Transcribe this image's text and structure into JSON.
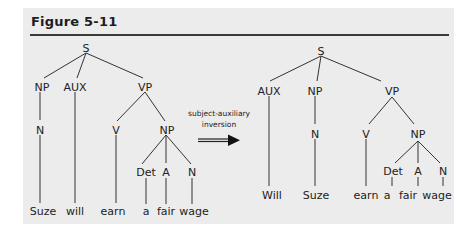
{
  "figure": {
    "title": "Figure 5-11",
    "transformation_label_line1": "subject-auxiliary",
    "transformation_label_line2": "inversion",
    "arrow": "double-line-right-arrow"
  },
  "left_tree": {
    "root": "S",
    "level1": [
      "NP",
      "AUX",
      "VP"
    ],
    "np_child": "N",
    "vp_children": [
      "V",
      "NP"
    ],
    "inner_np_children": [
      "Det",
      "A",
      "N"
    ],
    "words": [
      "Suze",
      "will",
      "earn",
      "a",
      "fair",
      "wage"
    ]
  },
  "right_tree": {
    "root": "S",
    "level1": [
      "AUX",
      "NP",
      "VP"
    ],
    "np_child": "N",
    "vp_children": [
      "V",
      "NP"
    ],
    "inner_np_children": [
      "Det",
      "A",
      "N"
    ],
    "words": [
      "Will",
      "Suze",
      "earn",
      "a",
      "fair",
      "wage"
    ]
  },
  "colors": {
    "panel_bg": "#ececec",
    "ink": "#222222"
  }
}
